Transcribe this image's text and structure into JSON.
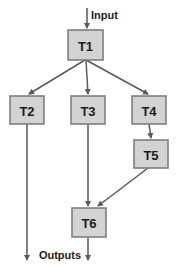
{
  "diagram": {
    "background": "#ffffff",
    "colors": {
      "node_fill": "#d3d3d3",
      "node_border": "#7f7f7f",
      "line": "#595959",
      "text": "#1c1c1c"
    },
    "labels": {
      "input": "Input",
      "outputs": "Outputs"
    },
    "nodes": [
      {
        "id": "T1",
        "label": "T1",
        "x": 68,
        "y": 30,
        "w": 35,
        "h": 30
      },
      {
        "id": "T2",
        "label": "T2",
        "x": 10,
        "y": 96,
        "w": 34,
        "h": 28
      },
      {
        "id": "T3",
        "label": "T3",
        "x": 71,
        "y": 96,
        "w": 34,
        "h": 28
      },
      {
        "id": "T4",
        "label": "T4",
        "x": 132,
        "y": 96,
        "w": 34,
        "h": 28
      },
      {
        "id": "T5",
        "label": "T5",
        "x": 134,
        "y": 140,
        "w": 34,
        "h": 28
      },
      {
        "id": "T6",
        "label": "T6",
        "x": 72,
        "y": 208,
        "w": 34,
        "h": 29
      }
    ],
    "edges": [
      {
        "name": "input-to-t1",
        "from": "Input",
        "to": "T1",
        "points": [
          [
            87,
            8
          ],
          [
            87,
            28
          ]
        ]
      },
      {
        "name": "t1-to-t2",
        "from": "T1",
        "to": "T2",
        "points": [
          [
            85,
            60
          ],
          [
            29,
            94
          ]
        ]
      },
      {
        "name": "t1-to-t3",
        "from": "T1",
        "to": "T3",
        "points": [
          [
            86,
            60
          ],
          [
            88,
            94
          ]
        ]
      },
      {
        "name": "t1-to-t4",
        "from": "T1",
        "to": "T4",
        "points": [
          [
            86,
            60
          ],
          [
            148,
            94
          ]
        ]
      },
      {
        "name": "t4-to-t5",
        "from": "T4",
        "to": "T5",
        "points": [
          [
            149,
            124
          ],
          [
            151,
            138
          ]
        ]
      },
      {
        "name": "t3-to-t6",
        "from": "T3",
        "to": "T6",
        "points": [
          [
            88,
            124
          ],
          [
            88,
            206
          ]
        ]
      },
      {
        "name": "t5-to-t6",
        "from": "T5",
        "to": "T6",
        "points": [
          [
            148,
            168
          ],
          [
            98,
            206
          ]
        ]
      },
      {
        "name": "t2-to-output",
        "from": "T2",
        "to": "Outputs",
        "points": [
          [
            27,
            124
          ],
          [
            27,
            260
          ]
        ]
      },
      {
        "name": "t6-to-output",
        "from": "T6",
        "to": "Outputs",
        "points": [
          [
            88,
            237
          ],
          [
            88,
            260
          ]
        ]
      }
    ]
  }
}
